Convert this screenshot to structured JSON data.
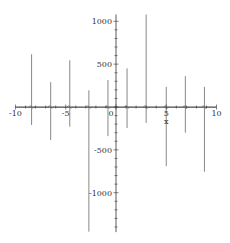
{
  "chart_data": {
    "type": "line",
    "title": "",
    "xlabel": "x",
    "ylabel": "",
    "xlim": [
      -10,
      10
    ],
    "ylim": [
      -1460,
      1080
    ],
    "grid": false,
    "legend": null,
    "x_ticks": [
      {
        "value": -10,
        "label": "-10"
      },
      {
        "value": -5,
        "label": "-5"
      },
      {
        "value": 0,
        "label": "0"
      },
      {
        "value": 5,
        "label": "5"
      },
      {
        "value": 10,
        "label": "10"
      }
    ],
    "y_ticks": [
      {
        "value": 1000,
        "label": "1000"
      },
      {
        "value": 500,
        "label": "500"
      },
      {
        "value": -500,
        "label": "-500"
      },
      {
        "value": -1000,
        "label": "-1000"
      }
    ],
    "series": [
      {
        "name": "f(x)",
        "color": "#888888",
        "spikes": [
          {
            "x": -8.4,
            "max": 615,
            "min": -210
          },
          {
            "x": -6.5,
            "max": 290,
            "min": -385
          },
          {
            "x": -4.6,
            "max": 545,
            "min": -230
          },
          {
            "x": -2.7,
            "max": 195,
            "min": -1455
          },
          {
            "x": -0.8,
            "max": 315,
            "min": -340
          },
          {
            "x": 1.1,
            "max": 450,
            "min": -245
          },
          {
            "x": 3.0,
            "max": 1080,
            "min": -185
          },
          {
            "x": 5.0,
            "max": 235,
            "min": -690
          },
          {
            "x": 6.9,
            "max": 360,
            "min": -300
          },
          {
            "x": 8.8,
            "max": 235,
            "min": -755
          }
        ]
      }
    ]
  },
  "colors": {
    "axis": "#333333",
    "curve": "#888888",
    "background": "#ffffff"
  }
}
